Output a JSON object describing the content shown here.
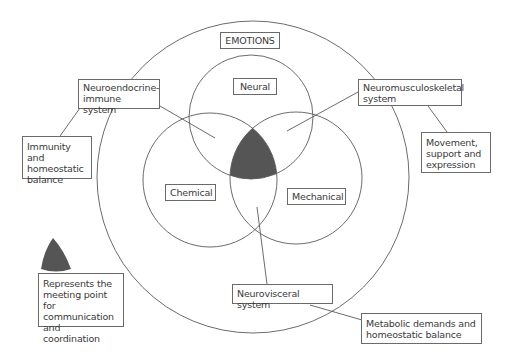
{
  "diagram": {
    "title": "EMOTIONS",
    "colors": {
      "line": "#5a5a5a",
      "meeting_point_fill": "#555555",
      "background": "#ffffff"
    },
    "circles": [
      {
        "id": "emotions-outer",
        "label": "EMOTIONS"
      },
      {
        "id": "neural",
        "label": "Neural"
      },
      {
        "id": "chemical",
        "label": "Chemical"
      },
      {
        "id": "mechanical",
        "label": "Mechanical"
      }
    ],
    "systems": {
      "neuroendocrine": "Neuroendocrine-\nimmune system",
      "neuromusculoskeletal": "Neuromusculoskeletal\nsystem",
      "neurovisceral": "Neurovisceral system"
    },
    "outcomes": {
      "immunity": "Immunity and\nhomeostatic\nbalance",
      "movement": "Movement,\nsupport and\nexpression",
      "metabolic": "Metabolic demands and\nhomeostatic balance"
    },
    "legend": {
      "symbol": "dark-curved-triangle",
      "text": "Represents the\nmeeting point for\ncommunication\nand coordination"
    }
  }
}
